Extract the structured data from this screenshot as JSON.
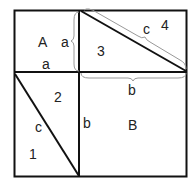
{
  "diagram": {
    "regions": {
      "A": "A",
      "B": "B",
      "t1": "1",
      "t2": "2",
      "t3": "3",
      "t4": "4"
    },
    "edges": {
      "a_top_brace": "a",
      "a_bottom": "a",
      "b_top_brace": "b",
      "b_left": "b",
      "c_top_brace": "c",
      "c_left": "c"
    },
    "colors": {
      "line": "#111111",
      "brace": "#999999",
      "text": "#222222"
    }
  }
}
